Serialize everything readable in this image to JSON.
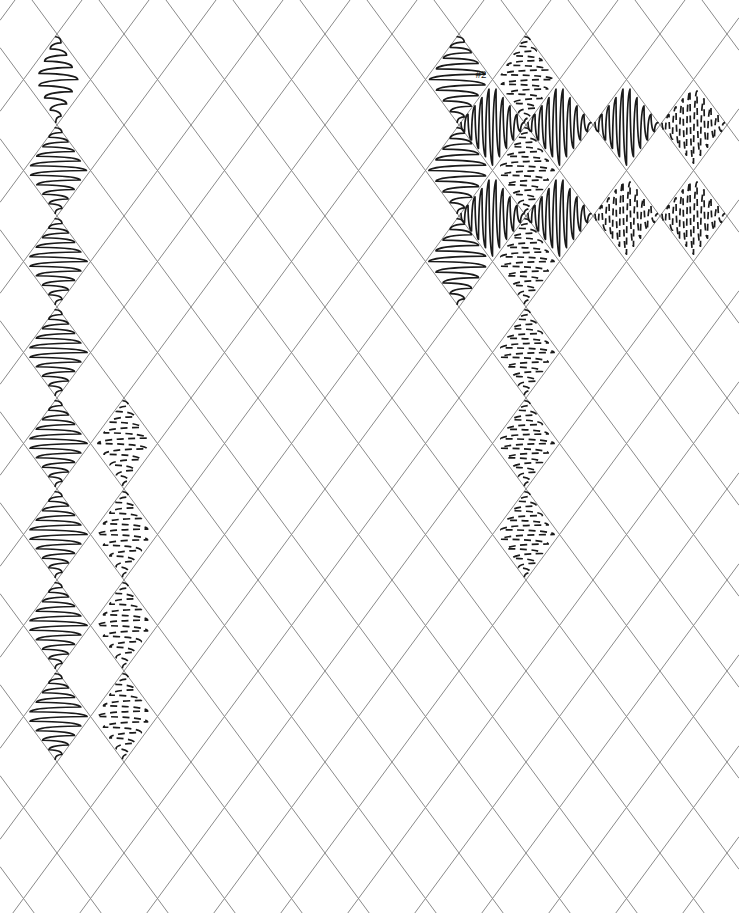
{
  "canvas": {
    "width": 739,
    "height": 913,
    "background_color": "#ffffff",
    "title": "Argyle lattice scribble-fill pattern sheet"
  },
  "lattice": {
    "grid_line_color": "#8a8a8a",
    "grid_line_width": 1,
    "cell_half_width": 33.5,
    "cell_half_height": 45.5,
    "origin_x": 57,
    "origin_y": 34,
    "columns": 12,
    "rows": 10,
    "orientation": "diamond"
  },
  "ink": {
    "stroke_color": "#1a1a1a",
    "stroke_width": 1.7,
    "dash_pattern": "7 4.5"
  },
  "annotations": [
    {
      "label": "#2",
      "x": 481,
      "y": 75,
      "font_size": 11,
      "color": "#111111"
    }
  ],
  "legend": {
    "fill_types": [
      {
        "key": "solid-horizontal",
        "label": "solid horizontal scribble"
      },
      {
        "key": "dashed-horizontal",
        "label": "dashed horizontal scribble"
      },
      {
        "key": "solid-vertical",
        "label": "solid vertical scribble"
      },
      {
        "key": "dashed-vertical",
        "label": "dashed vertical scribble"
      }
    ]
  },
  "filled_cells": [
    {
      "col": 0,
      "row": 0,
      "fill": "solid-horizontal",
      "density": 7,
      "amplitude": 0.62
    },
    {
      "col": 0,
      "row": 1,
      "fill": "solid-horizontal",
      "density": 9,
      "amplitude": 0.88
    },
    {
      "col": 0,
      "row": 2,
      "fill": "solid-horizontal",
      "density": 9,
      "amplitude": 0.9
    },
    {
      "col": 0,
      "row": 3,
      "fill": "solid-horizontal",
      "density": 9,
      "amplitude": 0.9
    },
    {
      "col": 0,
      "row": 4,
      "fill": "solid-horizontal",
      "density": 9,
      "amplitude": 0.9
    },
    {
      "col": 0,
      "row": 5,
      "fill": "solid-horizontal",
      "density": 9,
      "amplitude": 0.9
    },
    {
      "col": 0,
      "row": 6,
      "fill": "solid-horizontal",
      "density": 9,
      "amplitude": 0.9
    },
    {
      "col": 0,
      "row": 7,
      "fill": "solid-horizontal",
      "density": 9,
      "amplitude": 0.9
    },
    {
      "col": 1,
      "row": 4,
      "fill": "dashed-horizontal",
      "density": 8,
      "amplitude": 0.78
    },
    {
      "col": 1,
      "row": 5,
      "fill": "dashed-horizontal",
      "density": 8,
      "amplitude": 0.8
    },
    {
      "col": 1,
      "row": 6,
      "fill": "dashed-horizontal",
      "density": 8,
      "amplitude": 0.8
    },
    {
      "col": 1,
      "row": 7,
      "fill": "dashed-horizontal",
      "density": 8,
      "amplitude": 0.8
    },
    {
      "col": 6,
      "row": 0,
      "fill": "solid-horizontal",
      "density": 8,
      "amplitude": 0.88
    },
    {
      "col": 6,
      "row": 1,
      "fill": "solid-horizontal",
      "density": 8,
      "amplitude": 0.9
    },
    {
      "col": 6,
      "row": 2,
      "fill": "solid-horizontal",
      "density": 8,
      "amplitude": 0.9
    },
    {
      "col": 7,
      "row": 0,
      "fill": "dashed-horizontal",
      "density": 9,
      "amplitude": 0.82
    },
    {
      "col": 7,
      "row": 1,
      "fill": "dashed-horizontal",
      "density": 9,
      "amplitude": 0.84
    },
    {
      "col": 7,
      "row": 2,
      "fill": "dashed-horizontal",
      "density": 9,
      "amplitude": 0.84
    },
    {
      "col": 7,
      "row": 3,
      "fill": "dashed-horizontal",
      "density": 9,
      "amplitude": 0.84
    },
    {
      "col": 7,
      "row": 4,
      "fill": "dashed-horizontal",
      "density": 9,
      "amplitude": 0.84
    },
    {
      "col": 7,
      "row": 5,
      "fill": "dashed-horizontal",
      "density": 9,
      "amplitude": 0.84
    },
    {
      "col": 6,
      "row": 0,
      "fill": "solid-vertical",
      "density": 9,
      "amplitude": 0.88,
      "offset": "half"
    },
    {
      "col": 7,
      "row": 0,
      "fill": "solid-vertical",
      "density": 9,
      "amplitude": 0.88,
      "offset": "half"
    },
    {
      "col": 8,
      "row": 0,
      "fill": "solid-vertical",
      "density": 9,
      "amplitude": 0.88,
      "offset": "half"
    },
    {
      "col": 9,
      "row": 0,
      "fill": "dashed-vertical",
      "density": 9,
      "amplitude": 0.84,
      "offset": "half"
    },
    {
      "col": 6,
      "row": 1,
      "fill": "solid-vertical",
      "density": 9,
      "amplitude": 0.88,
      "offset": "half"
    },
    {
      "col": 7,
      "row": 1,
      "fill": "solid-vertical",
      "density": 9,
      "amplitude": 0.88,
      "offset": "half"
    },
    {
      "col": 8,
      "row": 1,
      "fill": "dashed-vertical",
      "density": 9,
      "amplitude": 0.84,
      "offset": "half"
    },
    {
      "col": 9,
      "row": 1,
      "fill": "dashed-vertical",
      "density": 9,
      "amplitude": 0.84,
      "offset": "half"
    }
  ]
}
